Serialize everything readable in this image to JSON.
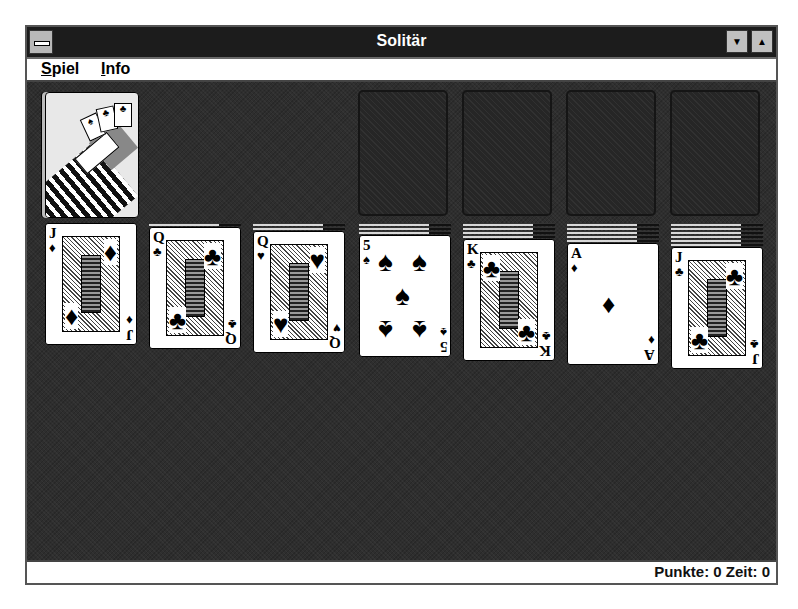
{
  "window": {
    "title": "Solitär",
    "controls": {
      "system_menu": "system-menu",
      "minimize": "▼",
      "maximize": "▲"
    }
  },
  "menu": [
    {
      "label": "Spiel",
      "accel": "S",
      "rest": "piel"
    },
    {
      "label": "Info",
      "accel": "I",
      "rest": "nfo"
    }
  ],
  "status": {
    "text": "Punkte: 0 Zeit: 0",
    "score_label": "Punkte",
    "score": 0,
    "time_label": "Zeit",
    "time": 0
  },
  "stock": {
    "state": "face-down deck",
    "back_design": "hand-with-cards"
  },
  "foundations": [
    {
      "state": "empty"
    },
    {
      "state": "empty"
    },
    {
      "state": "empty"
    },
    {
      "state": "empty"
    }
  ],
  "tableau": [
    {
      "hidden": 0,
      "top": {
        "rank": "J",
        "suit": "♦",
        "suit_name": "diamonds",
        "face": true
      }
    },
    {
      "hidden": 1,
      "top": {
        "rank": "Q",
        "suit": "♣",
        "suit_name": "clubs",
        "face": true
      }
    },
    {
      "hidden": 2,
      "top": {
        "rank": "Q",
        "suit": "♥",
        "suit_name": "hearts",
        "face": true
      }
    },
    {
      "hidden": 3,
      "top": {
        "rank": "5",
        "suit": "♠",
        "suit_name": "spades",
        "face": false
      }
    },
    {
      "hidden": 4,
      "top": {
        "rank": "K",
        "suit": "♣",
        "suit_name": "clubs",
        "face": true
      }
    },
    {
      "hidden": 5,
      "top": {
        "rank": "A",
        "suit": "♦",
        "suit_name": "diamonds",
        "face": false
      }
    },
    {
      "hidden": 6,
      "top": {
        "rank": "J",
        "suit": "♣",
        "suit_name": "clubs",
        "face": true
      }
    }
  ]
}
